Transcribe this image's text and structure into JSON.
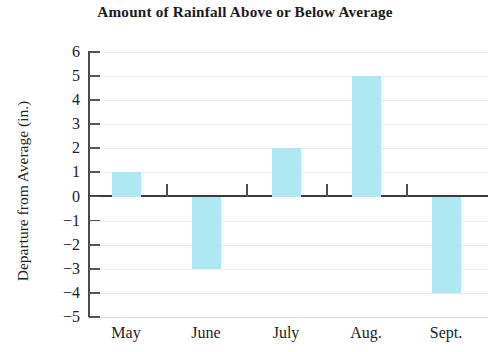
{
  "chart_data": {
    "type": "bar",
    "title": "Amount of Rainfall Above or Below Average",
    "xlabel": "",
    "ylabel": "Departure from Average (in.)",
    "categories": [
      "May",
      "June",
      "July",
      "Aug.",
      "Sept."
    ],
    "values": [
      1,
      -3,
      2,
      5,
      -4
    ],
    "ylim": [
      -5,
      6
    ],
    "ytick_labels": [
      "6",
      "5",
      "4",
      "3",
      "2",
      "1",
      "0",
      "−1",
      "−2",
      "−3",
      "−4",
      "−5"
    ],
    "ytick_values": [
      6,
      5,
      4,
      3,
      2,
      1,
      0,
      -1,
      -2,
      -3,
      -4,
      -5
    ],
    "grid": true,
    "legend": null,
    "bar_color": "#aee6f2",
    "axis_color": "#3a3a3a",
    "gridline_color": "#e9e9e9",
    "zero_line": 0
  }
}
